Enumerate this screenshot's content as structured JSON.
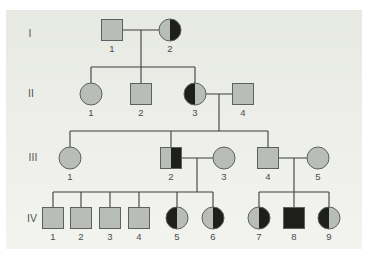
{
  "diagram": {
    "type": "pedigree-chart",
    "colors": {
      "page_bg": "#ffffff",
      "panel_top": "#e7e9e3",
      "panel_bottom": "#f3f4f0",
      "symbol_fill": "#b8bdb8",
      "affected_fill": "#1e1e1c",
      "symbol_outline": "#5f5f5f",
      "line_color": "#3d3d3d",
      "label_color": "#4a4a4a"
    },
    "symbol_size": 21,
    "generation_labels": [
      {
        "text": "I",
        "x": 30,
        "y": 37
      },
      {
        "text": "II",
        "x": 31,
        "y": 97
      },
      {
        "text": "III",
        "x": 33,
        "y": 161
      },
      {
        "text": "IV",
        "x": 32,
        "y": 222
      }
    ],
    "individuals": [
      {
        "id": "I-1",
        "label": "1",
        "shape": "square",
        "status": "unaffected",
        "x": 112,
        "y": 30
      },
      {
        "id": "I-2",
        "label": "2",
        "shape": "circle",
        "status": "right-half",
        "x": 170,
        "y": 30
      },
      {
        "id": "II-1",
        "label": "1",
        "shape": "circle",
        "status": "unaffected",
        "x": 91,
        "y": 94
      },
      {
        "id": "II-2",
        "label": "2",
        "shape": "square",
        "status": "unaffected",
        "x": 141,
        "y": 94
      },
      {
        "id": "II-3",
        "label": "3",
        "shape": "circle",
        "status": "left-half",
        "x": 195,
        "y": 94
      },
      {
        "id": "II-4",
        "label": "4",
        "shape": "square",
        "status": "unaffected",
        "x": 243,
        "y": 94
      },
      {
        "id": "III-1",
        "label": "1",
        "shape": "circle",
        "status": "unaffected",
        "x": 70,
        "y": 158
      },
      {
        "id": "III-2",
        "label": "2",
        "shape": "square",
        "status": "right-half",
        "x": 171,
        "y": 158
      },
      {
        "id": "III-3",
        "label": "3",
        "shape": "circle",
        "status": "unaffected",
        "x": 224,
        "y": 158
      },
      {
        "id": "III-4",
        "label": "4",
        "shape": "square",
        "status": "unaffected",
        "x": 268,
        "y": 158
      },
      {
        "id": "III-5",
        "label": "5",
        "shape": "circle",
        "status": "unaffected",
        "x": 318,
        "y": 158
      },
      {
        "id": "IV-1",
        "label": "1",
        "shape": "square",
        "status": "unaffected",
        "x": 53,
        "y": 218
      },
      {
        "id": "IV-2",
        "label": "2",
        "shape": "square",
        "status": "unaffected",
        "x": 81,
        "y": 218
      },
      {
        "id": "IV-3",
        "label": "3",
        "shape": "square",
        "status": "unaffected",
        "x": 110,
        "y": 218
      },
      {
        "id": "IV-4",
        "label": "4",
        "shape": "square",
        "status": "unaffected",
        "x": 139,
        "y": 218
      },
      {
        "id": "IV-5",
        "label": "5",
        "shape": "circle",
        "status": "left-half",
        "x": 177,
        "y": 218
      },
      {
        "id": "IV-6",
        "label": "6",
        "shape": "circle",
        "status": "right-half",
        "x": 213,
        "y": 218
      },
      {
        "id": "IV-7",
        "label": "7",
        "shape": "circle",
        "status": "right-half",
        "x": 259,
        "y": 218
      },
      {
        "id": "IV-8",
        "label": "8",
        "shape": "square",
        "status": "affected",
        "x": 294,
        "y": 218
      },
      {
        "id": "IV-9",
        "label": "9",
        "shape": "circle",
        "status": "left-half",
        "x": 329,
        "y": 218
      }
    ],
    "connections": [
      {
        "name": "marriage-line-I-1-I-2",
        "x1": 112,
        "y1": 30,
        "x2": 170,
        "y2": 30
      },
      {
        "name": "descent-line-gen-I",
        "x1": 141,
        "y1": 30,
        "x2": 141,
        "y2": 67
      },
      {
        "name": "sibship-bar-gen-II",
        "x1": 91,
        "y1": 67,
        "x2": 195,
        "y2": 67
      },
      {
        "name": "drop-line-II-1",
        "x1": 91,
        "y1": 67,
        "x2": 91,
        "y2": 94
      },
      {
        "name": "drop-line-II-2",
        "x1": 141,
        "y1": 67,
        "x2": 141,
        "y2": 94
      },
      {
        "name": "drop-line-II-3",
        "x1": 195,
        "y1": 67,
        "x2": 195,
        "y2": 94
      },
      {
        "name": "marriage-line-II-3-II-4",
        "x1": 195,
        "y1": 94,
        "x2": 243,
        "y2": 94
      },
      {
        "name": "descent-line-gen-II",
        "x1": 219,
        "y1": 94,
        "x2": 219,
        "y2": 131
      },
      {
        "name": "sibship-bar-gen-III",
        "x1": 70,
        "y1": 131,
        "x2": 268,
        "y2": 131
      },
      {
        "name": "drop-line-III-1",
        "x1": 70,
        "y1": 131,
        "x2": 70,
        "y2": 158
      },
      {
        "name": "drop-line-III-2",
        "x1": 171,
        "y1": 131,
        "x2": 171,
        "y2": 158
      },
      {
        "name": "drop-line-III-4",
        "x1": 268,
        "y1": 131,
        "x2": 268,
        "y2": 158
      },
      {
        "name": "marriage-line-III-2-III-3",
        "x1": 171,
        "y1": 158,
        "x2": 224,
        "y2": 158
      },
      {
        "name": "descent-line-III-left",
        "x1": 197,
        "y1": 158,
        "x2": 197,
        "y2": 192
      },
      {
        "name": "marriage-line-III-4-III-5",
        "x1": 268,
        "y1": 158,
        "x2": 318,
        "y2": 158
      },
      {
        "name": "descent-line-III-right",
        "x1": 294,
        "y1": 158,
        "x2": 294,
        "y2": 192
      },
      {
        "name": "sibship-bar-IV-left",
        "x1": 53,
        "y1": 192,
        "x2": 213,
        "y2": 192
      },
      {
        "name": "drop-line-IV-1",
        "x1": 53,
        "y1": 192,
        "x2": 53,
        "y2": 218
      },
      {
        "name": "drop-line-IV-2",
        "x1": 81,
        "y1": 192,
        "x2": 81,
        "y2": 218
      },
      {
        "name": "drop-line-IV-3",
        "x1": 110,
        "y1": 192,
        "x2": 110,
        "y2": 218
      },
      {
        "name": "drop-line-IV-4",
        "x1": 139,
        "y1": 192,
        "x2": 139,
        "y2": 218
      },
      {
        "name": "drop-line-IV-5",
        "x1": 177,
        "y1": 192,
        "x2": 177,
        "y2": 218
      },
      {
        "name": "drop-line-IV-6",
        "x1": 213,
        "y1": 192,
        "x2": 213,
        "y2": 218
      },
      {
        "name": "sibship-bar-IV-right",
        "x1": 259,
        "y1": 192,
        "x2": 329,
        "y2": 192
      },
      {
        "name": "drop-line-IV-7",
        "x1": 259,
        "y1": 192,
        "x2": 259,
        "y2": 218
      },
      {
        "name": "drop-line-IV-8",
        "x1": 294,
        "y1": 192,
        "x2": 294,
        "y2": 218
      },
      {
        "name": "drop-line-IV-9",
        "x1": 329,
        "y1": 192,
        "x2": 329,
        "y2": 218
      }
    ]
  }
}
